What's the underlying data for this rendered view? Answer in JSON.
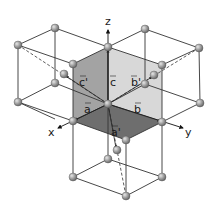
{
  "diagram": {
    "axes": {
      "x": "x",
      "y": "y",
      "z": "z"
    },
    "vectors": {
      "a": "a",
      "b": "b",
      "c": "c",
      "a_prime": "a'",
      "b_prime": "b'",
      "c_prime": "c'"
    },
    "colors": {
      "face_top_left": "#a3a3a3",
      "face_top_right": "#d8d8d8",
      "face_bottom": "#6e6e6e",
      "line": "#333333",
      "sphere": "#9a9a9a"
    }
  }
}
